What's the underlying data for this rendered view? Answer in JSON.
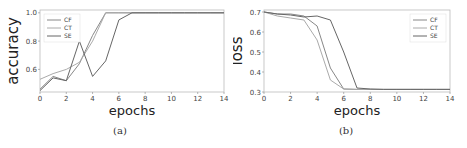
{
  "chart_data": [
    {
      "type": "line",
      "caption": "(a)",
      "title": "",
      "xlabel": "epochs",
      "ylabel": "accuracy",
      "xlim": [
        0,
        14
      ],
      "ylim": [
        0.44,
        1.02
      ],
      "xticks": [
        0,
        2,
        4,
        6,
        8,
        10,
        12,
        14
      ],
      "yticks": [
        0.6,
        0.8,
        1.0
      ],
      "grid": false,
      "legend_position": "upper left",
      "x": [
        0,
        1,
        2,
        3,
        4,
        5,
        6,
        7,
        8,
        9,
        10,
        11,
        12,
        13,
        14
      ],
      "series": [
        {
          "name": "CF",
          "color": "#888888",
          "values": [
            0.46,
            0.55,
            0.52,
            0.64,
            0.84,
            1.0,
            1.0,
            1.0,
            1.0,
            1.0,
            1.0,
            1.0,
            1.0,
            1.0,
            1.0
          ]
        },
        {
          "name": "CT",
          "color": "#aaaaaa",
          "values": [
            0.53,
            0.57,
            0.6,
            0.65,
            0.8,
            1.0,
            1.0,
            1.0,
            1.0,
            1.0,
            1.0,
            1.0,
            1.0,
            1.0,
            1.0
          ]
        },
        {
          "name": "SE",
          "color": "#666666",
          "values": [
            0.45,
            0.54,
            0.52,
            0.8,
            0.55,
            0.66,
            0.95,
            1.0,
            1.0,
            1.0,
            1.0,
            1.0,
            1.0,
            1.0,
            1.0
          ]
        }
      ]
    },
    {
      "type": "line",
      "caption": "(b)",
      "title": "",
      "xlabel": "epochs",
      "ylabel": "loss",
      "xlim": [
        0,
        14
      ],
      "ylim": [
        0.3,
        0.71
      ],
      "xticks": [
        0,
        2,
        4,
        6,
        8,
        10,
        12,
        14
      ],
      "yticks": [
        0.3,
        0.4,
        0.5,
        0.6,
        0.7
      ],
      "grid": false,
      "legend_position": "upper right",
      "x": [
        0,
        1,
        2,
        3,
        4,
        5,
        6,
        7,
        8,
        9,
        10,
        11,
        12,
        13,
        14
      ],
      "series": [
        {
          "name": "CF",
          "color": "#888888",
          "values": [
            0.7,
            0.69,
            0.69,
            0.68,
            0.63,
            0.42,
            0.315,
            0.313,
            0.313,
            0.313,
            0.313,
            0.313,
            0.313,
            0.313,
            0.313
          ]
        },
        {
          "name": "CT",
          "color": "#aaaaaa",
          "values": [
            0.7,
            0.68,
            0.67,
            0.66,
            0.56,
            0.36,
            0.315,
            0.313,
            0.313,
            0.313,
            0.313,
            0.313,
            0.313,
            0.313,
            0.313
          ]
        },
        {
          "name": "SE",
          "color": "#666666",
          "values": [
            0.7,
            0.69,
            0.685,
            0.675,
            0.68,
            0.66,
            0.5,
            0.32,
            0.315,
            0.313,
            0.313,
            0.313,
            0.313,
            0.313,
            0.313
          ]
        }
      ]
    }
  ]
}
